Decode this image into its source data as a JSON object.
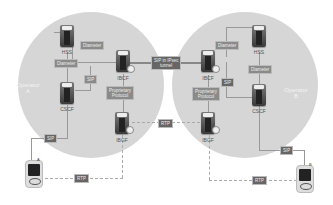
{
  "diagram": {
    "operators": [
      {
        "id": "operator-a",
        "label": "Operator\nA",
        "label_line1": "Operator",
        "label_line2": "A"
      },
      {
        "id": "operator-b",
        "label": "Operator\nB",
        "label_line1": "Operator",
        "label_line2": "B"
      }
    ],
    "nodes": {
      "a_hss": "HSS",
      "a_cscf": "CSCF",
      "a_ibcf": "IBCF",
      "a_ibgf": "IBGF",
      "b_hss": "HSS",
      "b_cscf": "CSCF",
      "b_ibcf": "IBCF",
      "b_ibgf": "IBGF"
    },
    "tags": {
      "a_diameter_top": "Diameter",
      "a_diameter_left": "Diameter",
      "a_sip_inner": "SIP",
      "a_proprietary": "Proprietary Protocol",
      "a_proprietary_l1": "Proprietary",
      "a_proprietary_l2": "Protocol",
      "a_sip_ue": "SIP",
      "a_rtp_ue": "RTP",
      "interconnect_sip": "SIP in IPsec tunnel",
      "interconnect_sip_l1": "SIP in IPsec",
      "interconnect_sip_l2": "tunnel",
      "interconnect_rtp": "RTP",
      "b_diameter_top": "Diameter",
      "b_diameter_right": "Diameter",
      "b_sip_inner": "SIP",
      "b_proprietary_l1": "Proprietary",
      "b_proprietary_l2": "Protocol",
      "b_sip_ue": "SIP",
      "b_rtp_ue": "RTP"
    },
    "terminals": {
      "a_ue_label": "A",
      "b_ue_label": "B"
    }
  }
}
